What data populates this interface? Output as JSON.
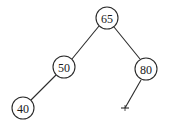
{
  "diagram": {
    "type": "binary-tree",
    "nodes": [
      {
        "id": "n65",
        "label": "65",
        "x": 107,
        "y": 18
      },
      {
        "id": "n50",
        "label": "50",
        "x": 64,
        "y": 67
      },
      {
        "id": "n80",
        "label": "80",
        "x": 146,
        "y": 69
      },
      {
        "id": "n40",
        "label": "40",
        "x": 23,
        "y": 108
      }
    ],
    "edges": [
      {
        "from": "n65",
        "to": "n50"
      },
      {
        "from": "n65",
        "to": "n80"
      },
      {
        "from": "n50",
        "to": "n40"
      },
      {
        "from": "n80",
        "to": "null-leaf"
      }
    ],
    "null_leaf": {
      "x": 125,
      "y": 108
    }
  }
}
